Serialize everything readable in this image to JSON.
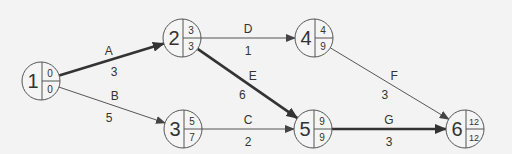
{
  "diagram": {
    "type": "activity-on-arrow network (critical path)",
    "background": "#f3f3f3",
    "colors": {
      "normal": "#444444",
      "critical": "#333333",
      "text": "#333333"
    },
    "nodes": [
      {
        "id": "1",
        "x": 41,
        "y": 81,
        "top": "0",
        "bottom": "0"
      },
      {
        "id": "2",
        "x": 182,
        "y": 38,
        "top": "3",
        "bottom": "3"
      },
      {
        "id": "3",
        "x": 183,
        "y": 129,
        "top": "5",
        "bottom": "7"
      },
      {
        "id": "4",
        "x": 314,
        "y": 38,
        "top": "4",
        "bottom": "9"
      },
      {
        "id": "5",
        "x": 313,
        "y": 129,
        "top": "9",
        "bottom": "9"
      },
      {
        "id": "6",
        "x": 465,
        "y": 129,
        "top": "12",
        "bottom": "12"
      }
    ],
    "edges": [
      {
        "activity": "A",
        "duration": "3",
        "from": "1",
        "to": "2",
        "critical": true
      },
      {
        "activity": "B",
        "duration": "5",
        "from": "1",
        "to": "3",
        "critical": false
      },
      {
        "activity": "C",
        "duration": "2",
        "from": "3",
        "to": "5",
        "critical": false
      },
      {
        "activity": "D",
        "duration": "1",
        "from": "2",
        "to": "4",
        "critical": false
      },
      {
        "activity": "E",
        "duration": "6",
        "from": "2",
        "to": "5",
        "critical": true
      },
      {
        "activity": "F",
        "duration": "3",
        "from": "4",
        "to": "6",
        "critical": false
      },
      {
        "activity": "G",
        "duration": "3",
        "from": "5",
        "to": "6",
        "critical": true
      }
    ]
  }
}
